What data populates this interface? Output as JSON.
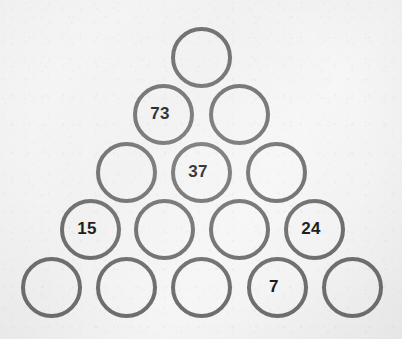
{
  "puzzle": {
    "type": "number-pyramid",
    "title": "Number Pyramid",
    "row_count": 5,
    "geometry": {
      "canvas_width": 402,
      "canvas_height": 339,
      "circle_diameter": 61,
      "horizontal_spacing": 75,
      "vertical_spacing": 57,
      "stroke_width": 4
    },
    "colors": {
      "background": "#f4f4f4",
      "circle_stroke": "#6e6e6e",
      "number_text": "#1a1a1a"
    },
    "rows": [
      {
        "index": 1,
        "cells": [
          {
            "id": "r1c1",
            "value": "",
            "filled": false,
            "cx": 201,
            "cy": 57
          }
        ]
      },
      {
        "index": 2,
        "cells": [
          {
            "id": "r2c1",
            "value": "73",
            "filled": true,
            "cx": 163,
            "cy": 114
          },
          {
            "id": "r2c2",
            "value": "",
            "filled": false,
            "cx": 239,
            "cy": 114
          }
        ]
      },
      {
        "index": 3,
        "cells": [
          {
            "id": "r3c1",
            "value": "",
            "filled": false,
            "cx": 126,
            "cy": 172
          },
          {
            "id": "r3c2",
            "value": "37",
            "filled": true,
            "cx": 201,
            "cy": 172
          },
          {
            "id": "r3c3",
            "value": "",
            "filled": false,
            "cx": 276,
            "cy": 172
          }
        ]
      },
      {
        "index": 4,
        "cells": [
          {
            "id": "r4c1",
            "value": "15",
            "filled": true,
            "cx": 90,
            "cy": 229
          },
          {
            "id": "r4c2",
            "value": "",
            "filled": false,
            "cx": 164,
            "cy": 229
          },
          {
            "id": "r4c3",
            "value": "",
            "filled": false,
            "cx": 239,
            "cy": 229
          },
          {
            "id": "r4c4",
            "value": "24",
            "filled": true,
            "cx": 314,
            "cy": 229
          }
        ]
      },
      {
        "index": 5,
        "cells": [
          {
            "id": "r5c1",
            "value": "",
            "filled": false,
            "cx": 51,
            "cy": 287
          },
          {
            "id": "r5c2",
            "value": "",
            "filled": false,
            "cx": 126,
            "cy": 287
          },
          {
            "id": "r5c3",
            "value": "",
            "filled": false,
            "cx": 201,
            "cy": 287
          },
          {
            "id": "r5c4",
            "value": "7",
            "filled": true,
            "cx": 277,
            "cy": 287
          },
          {
            "id": "r5c5",
            "value": "",
            "filled": false,
            "cx": 352,
            "cy": 287
          }
        ]
      }
    ],
    "given_values": [
      "73",
      "37",
      "15",
      "24",
      "7"
    ],
    "font_size_px": 17
  }
}
